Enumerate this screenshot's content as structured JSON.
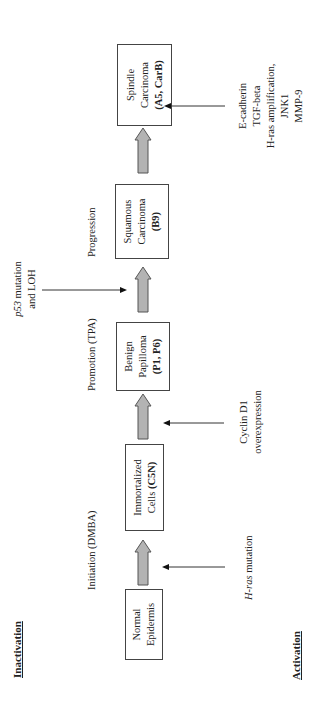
{
  "headers": {
    "inactivation": "Inactivation",
    "activation": "Activation"
  },
  "stages": [
    {
      "label": "Initiation (DMBA)"
    },
    {
      "label": "Promotion (TPA)"
    },
    {
      "label": "Progression"
    }
  ],
  "boxes": [
    {
      "line1": "Normal",
      "line2": "Epidermis",
      "bold": ""
    },
    {
      "line1": "Immortalized",
      "line2": "Cells ",
      "bold": "(C5N)"
    },
    {
      "line1": "Benign",
      "line2": "Papilloma",
      "bold": "(P1, P6)"
    },
    {
      "line1": "Squamous",
      "line2": "Carcinoma",
      "bold": "(B9)"
    },
    {
      "line1": "Spindle",
      "line2": "Carcinoma",
      "bold": "(A5, CarB)"
    }
  ],
  "inactivation_events": [
    {
      "italic": "p53",
      "rest": " mutation",
      "line2": "and LOH"
    }
  ],
  "activation_events": [
    {
      "italic": "H-ras",
      "rest": " mutation"
    },
    {
      "line1": "Cyclin D1",
      "line2": "overexpression"
    },
    {
      "lines": [
        "E-cadherin",
        "TGF-beta",
        "H-ras amplification,",
        "JNK1",
        "MMP-9"
      ]
    }
  ],
  "colors": {
    "arrow_fill": "#b3b3b3",
    "arrow_stroke": "#555555",
    "box_border": "#444444",
    "text": "#222222"
  }
}
